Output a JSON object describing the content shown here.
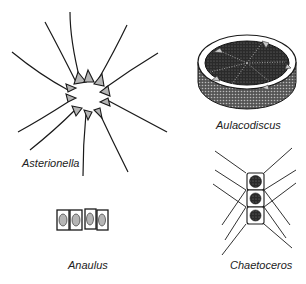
{
  "figure": {
    "specimens": [
      {
        "id": "asterionella",
        "label": "Asterionella"
      },
      {
        "id": "aulacodiscus",
        "label": "Aulacodiscus"
      },
      {
        "id": "anaulus",
        "label": "Anaulus"
      },
      {
        "id": "chaetoceros",
        "label": "Chaetoceros"
      }
    ]
  },
  "colors": {
    "ink": "#1a1a1a",
    "background": "#ffffff",
    "shade": "#3a3a3a"
  }
}
